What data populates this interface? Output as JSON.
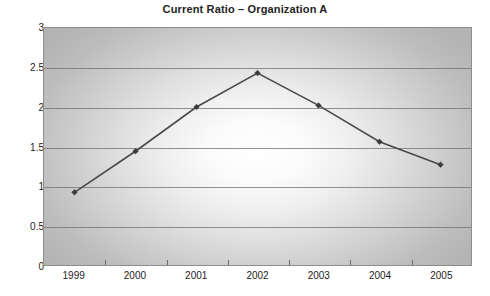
{
  "chart_data": {
    "type": "line",
    "title": "Current Ratio – Organization A",
    "xlabel": "",
    "ylabel": "",
    "categories": [
      "1999",
      "2000",
      "2001",
      "2002",
      "2003",
      "2004",
      "2005"
    ],
    "values": [
      0.92,
      1.44,
      2.0,
      2.43,
      2.02,
      1.56,
      1.27
    ],
    "series": [
      {
        "name": "Current Ratio",
        "values": [
          0.92,
          1.44,
          2.0,
          2.43,
          2.02,
          1.56,
          1.27
        ]
      }
    ],
    "ylim": [
      0,
      3
    ],
    "yticks": [
      0,
      0.5,
      1,
      1.5,
      2,
      2.5,
      3
    ],
    "ytick_labels": [
      "0",
      "0.5",
      "1",
      "1.5",
      "2",
      "2.5",
      "3"
    ],
    "grid": true,
    "legend": false,
    "legend_position": "none",
    "marker": "diamond",
    "colors": {
      "line": "#4a4a4a",
      "marker": "#3b3b3b",
      "plot_background": "#c6c6c6",
      "gridline": "#6f6f6f",
      "border": "#8e8e8e",
      "title_text": "#242424",
      "axis_text": "#1d1d1d"
    }
  }
}
